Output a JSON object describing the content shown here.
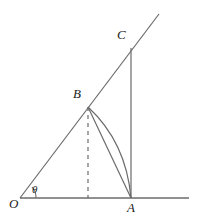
{
  "figure": {
    "type": "geometry-diagram",
    "background_color": "#ffffff",
    "stroke_color": "#555555",
    "label_color": "#1a1a1a",
    "canvas": {
      "width": 198,
      "height": 224
    },
    "points": {
      "O": {
        "x": 20,
        "y": 198,
        "label": "O",
        "label_x": 10,
        "label_y": 198
      },
      "A": {
        "x": 131,
        "y": 198,
        "label": "A",
        "label_x": 128,
        "label_y": 202
      },
      "B": {
        "x": 88,
        "y": 107,
        "label": "B",
        "label_x": 74,
        "label_y": 88
      },
      "C": {
        "x": 131,
        "y": 48,
        "label": "C",
        "label_x": 118,
        "label_y": 29
      },
      "F": {
        "x": 88,
        "y": 198
      },
      "ray_end": {
        "x": 159,
        "y": 14
      },
      "axis_end": {
        "x": 189,
        "y": 198
      }
    },
    "angle": {
      "label": "θ",
      "label_x": 31,
      "label_y": 184,
      "vertex": "O",
      "arc_radius": 16
    },
    "segments": [
      {
        "name": "x-axis",
        "from": "O",
        "to": "axis_end",
        "style": "solid"
      },
      {
        "name": "ray-OC",
        "from": "O",
        "to": "ray_end",
        "style": "solid"
      },
      {
        "name": "segment-CA",
        "from": "C",
        "to": "A",
        "style": "solid"
      },
      {
        "name": "segment-BA",
        "from": "B",
        "to": "A",
        "style": "solid"
      },
      {
        "name": "perpendicular-BF",
        "from": "B",
        "to": "F",
        "style": "dashed"
      }
    ],
    "arcs": [
      {
        "name": "arc-BA",
        "from": "B",
        "to": "A",
        "bulge": "right",
        "control_x": 126,
        "control_y": 142
      }
    ]
  }
}
